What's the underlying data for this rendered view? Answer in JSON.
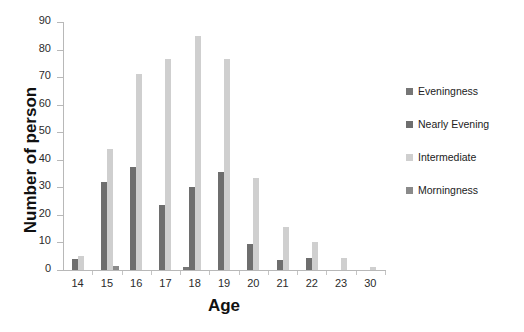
{
  "chart_data": {
    "type": "bar",
    "title": "",
    "xlabel": "Age",
    "ylabel": "Number of person",
    "categories": [
      "14",
      "15",
      "16",
      "17",
      "18",
      "19",
      "20",
      "21",
      "22",
      "23",
      "30"
    ],
    "ylim": [
      0,
      90
    ],
    "yticks": [
      0,
      10,
      20,
      30,
      40,
      50,
      60,
      70,
      80,
      90
    ],
    "grid": false,
    "legend_position": "right",
    "series": [
      {
        "name": "Eveningness",
        "color": "#767676",
        "values": [
          0,
          0,
          0,
          0,
          1,
          0,
          0,
          0,
          0,
          0,
          0
        ]
      },
      {
        "name": "Nearly Evening",
        "color": "#6e6e6e",
        "values": [
          4,
          32,
          37.5,
          23.5,
          30,
          35.5,
          9.5,
          3.5,
          4.5,
          0,
          0
        ]
      },
      {
        "name": "Intermediate",
        "color": "#cfcfcf",
        "values": [
          5,
          44,
          71,
          76.5,
          85,
          76.5,
          33.5,
          15.5,
          10,
          4.5,
          1
        ]
      },
      {
        "name": "Morningness",
        "color": "#8a8a8a",
        "values": [
          0,
          1.5,
          0,
          0,
          0,
          0,
          0,
          0,
          0,
          0,
          0
        ]
      }
    ]
  },
  "legend": {
    "items": [
      {
        "label": "Eveningness",
        "color": "#767676"
      },
      {
        "label": "Nearly Evening",
        "color": "#6e6e6e"
      },
      {
        "label": "Intermediate",
        "color": "#cfcfcf"
      },
      {
        "label": "Morningness",
        "color": "#8a8a8a"
      }
    ]
  }
}
